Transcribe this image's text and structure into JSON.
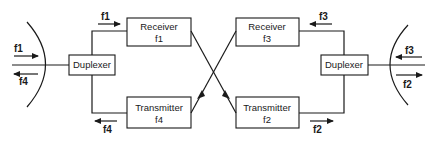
{
  "diagram": {
    "type": "satellite-repeater-block-diagram",
    "left_duplexer": {
      "label": "Duplexer"
    },
    "right_duplexer": {
      "label": "Duplexer"
    },
    "receiver_left": {
      "label": "Receiver",
      "freq": "f1"
    },
    "transmitter_left": {
      "label": "Transmitter",
      "freq": "f4"
    },
    "receiver_right": {
      "label": "Receiver",
      "freq": "f3"
    },
    "transmitter_right": {
      "label": "Transmitter",
      "freq": "f2"
    },
    "arrows": {
      "left_antenna_in": "f1",
      "left_antenna_out": "f4",
      "left_rx_path": "f1",
      "left_tx_path": "f4",
      "right_antenna_in": "f3",
      "right_antenna_out": "f2",
      "right_rx_path": "f3",
      "right_tx_path": "f2"
    },
    "colors": {
      "ink": "#1a1a1a",
      "background": "#ffffff"
    }
  }
}
